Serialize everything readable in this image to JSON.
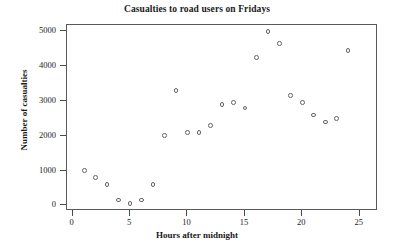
{
  "chart_data": {
    "type": "scatter",
    "title": "Casualties to road users on Fridays",
    "xlabel": "Hours after midnight",
    "ylabel": "Number of casualties",
    "xlim": [
      -0.5,
      26.6
    ],
    "ylim": [
      -160,
      5180
    ],
    "grid": false,
    "legend": null,
    "xticks": [
      0,
      5,
      10,
      15,
      20,
      25
    ],
    "yticks": [
      0,
      1000,
      2000,
      3000,
      4000,
      5000
    ],
    "xtick_labels": [
      "0",
      "5",
      "10",
      "15",
      "20",
      "25"
    ],
    "ytick_labels": [
      "0",
      "1000",
      "2000",
      "3000",
      "4000",
      "5000"
    ],
    "marker": "open-circle",
    "marker_color": "#63636b",
    "x": [
      1,
      2,
      3,
      4,
      5,
      6,
      7,
      8,
      9,
      10,
      11,
      12,
      13,
      14,
      15,
      16,
      17,
      18,
      19,
      20,
      21,
      22,
      23,
      24
    ],
    "y": [
      1000,
      800,
      600,
      150,
      50,
      150,
      600,
      2000,
      3300,
      2100,
      2100,
      2300,
      2900,
      2950,
      2800,
      4250,
      5000,
      4650,
      3150,
      2950,
      2600,
      2400,
      2500,
      4450
    ],
    "points": [
      {
        "hour": 1,
        "casualties": 1000
      },
      {
        "hour": 2,
        "casualties": 800
      },
      {
        "hour": 3,
        "casualties": 600
      },
      {
        "hour": 4,
        "casualties": 150
      },
      {
        "hour": 5,
        "casualties": 50
      },
      {
        "hour": 6,
        "casualties": 150
      },
      {
        "hour": 7,
        "casualties": 600
      },
      {
        "hour": 8,
        "casualties": 2000
      },
      {
        "hour": 9,
        "casualties": 3300
      },
      {
        "hour": 10,
        "casualties": 2100
      },
      {
        "hour": 11,
        "casualties": 2100
      },
      {
        "hour": 12,
        "casualties": 2300
      },
      {
        "hour": 13,
        "casualties": 2900
      },
      {
        "hour": 14,
        "casualties": 2950
      },
      {
        "hour": 15,
        "casualties": 2800
      },
      {
        "hour": 16,
        "casualties": 4250
      },
      {
        "hour": 17,
        "casualties": 5000
      },
      {
        "hour": 18,
        "casualties": 4650
      },
      {
        "hour": 19,
        "casualties": 3150
      },
      {
        "hour": 20,
        "casualties": 2950
      },
      {
        "hour": 21,
        "casualties": 2600
      },
      {
        "hour": 22,
        "casualties": 2400
      },
      {
        "hour": 23,
        "casualties": 2500
      },
      {
        "hour": 24,
        "casualties": 4450
      }
    ]
  }
}
